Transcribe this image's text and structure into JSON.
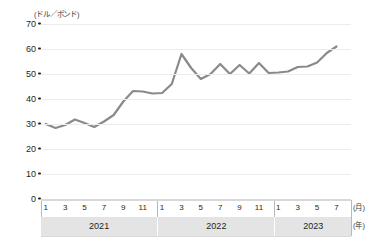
{
  "axes": {
    "y_unit_label": "(ドル／ポンド)",
    "y_ticks": [
      70,
      60,
      50,
      40,
      30,
      20,
      10,
      0
    ],
    "y_min": 0,
    "y_max": 70,
    "x_month_unit_label": "(月)",
    "x_year_unit_label": "(年)"
  },
  "panels": [
    {
      "year": "2021",
      "month_ticks": [
        "1",
        "3",
        "5",
        "7",
        "9",
        "11"
      ],
      "months_span": 12
    },
    {
      "year": "2022",
      "month_ticks": [
        "1",
        "3",
        "5",
        "7",
        "9",
        "11"
      ],
      "months_span": 12
    },
    {
      "year": "2023",
      "month_ticks": [
        "1",
        "3",
        "5",
        "7"
      ],
      "months_span": 8
    }
  ],
  "style": {
    "line_color": "#8a8a8a",
    "grid_color": "#ececec",
    "axis_color": "#d8d8d8",
    "year_band_color": "#e4e4e4",
    "text_color": "#231f20"
  },
  "chart_data": {
    "type": "line",
    "title": "",
    "subtitle": "",
    "xlabel": "(月) / (年)",
    "ylabel": "(ドル／ポンド)",
    "ylim": [
      0,
      70
    ],
    "xlim": [
      "2021-01",
      "2023-07"
    ],
    "grid": true,
    "legend": "none",
    "y_tick_labels": [
      "0",
      "10",
      "20",
      "30",
      "40",
      "50",
      "60",
      "70"
    ],
    "x_tick_labels": [
      "1",
      "3",
      "5",
      "7",
      "9",
      "11",
      "1",
      "3",
      "5",
      "7",
      "9",
      "11",
      "1",
      "3",
      "5",
      "7"
    ],
    "x": [
      "2021-01",
      "2021-02",
      "2021-03",
      "2021-04",
      "2021-05",
      "2021-06",
      "2021-07",
      "2021-08",
      "2021-09",
      "2021-10",
      "2021-11",
      "2021-12",
      "2022-01",
      "2022-02",
      "2022-03",
      "2022-04",
      "2022-05",
      "2022-06",
      "2022-07",
      "2022-08",
      "2022-09",
      "2022-10",
      "2022-11",
      "2022-12",
      "2023-01",
      "2023-02",
      "2023-03",
      "2023-04",
      "2023-05",
      "2023-06",
      "2023-07"
    ],
    "series": [
      {
        "name": "価格",
        "values": [
          30.0,
          28.4,
          29.6,
          31.8,
          30.4,
          28.8,
          31.0,
          33.6,
          39.0,
          43.2,
          43.0,
          42.2,
          42.4,
          46.0,
          58.0,
          52.4,
          48.0,
          50.0,
          54.0,
          50.0,
          53.6,
          50.2,
          54.4,
          50.4,
          50.6,
          51.0,
          52.8,
          53.0,
          54.6,
          58.4,
          61.0
        ]
      }
    ]
  }
}
